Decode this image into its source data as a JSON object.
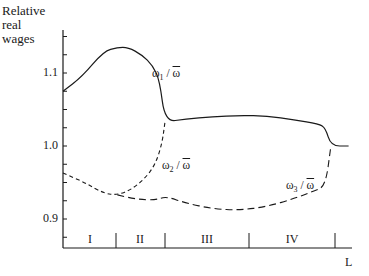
{
  "chart_data": {
    "type": "line",
    "title": "",
    "ylabel": "Relative real wages",
    "ylabel_lines": [
      "Relative",
      "real",
      "wages"
    ],
    "xlabel": "L",
    "ylim": [
      0.86,
      1.16
    ],
    "yticks": [
      {
        "value": 0.9,
        "label": "0.9"
      },
      {
        "value": 1.0,
        "label": "1.0"
      },
      {
        "value": 1.1,
        "label": "1.1"
      }
    ],
    "minor_tick_step": 0.025,
    "grid": false,
    "legend": "none (inline labels)",
    "sections": [
      {
        "label": "I",
        "x_start": 0.0,
        "x_end": 0.195
      },
      {
        "label": "II",
        "x_start": 0.195,
        "x_end": 0.375
      },
      {
        "label": "III",
        "x_start": 0.375,
        "x_end": 0.685
      },
      {
        "label": "IV",
        "x_start": 0.685,
        "x_end": 1.0
      }
    ],
    "series": [
      {
        "name": "ω1 / ω̄",
        "style": "solid",
        "x": [
          0.0,
          0.07,
          0.15,
          0.2,
          0.24,
          0.29,
          0.33,
          0.355,
          0.375,
          0.45,
          0.55,
          0.65,
          0.75,
          0.85,
          0.94,
          0.965,
          0.985,
          1.05
        ],
        "y": [
          1.075,
          1.095,
          1.13,
          1.135,
          1.135,
          1.125,
          1.11,
          1.09,
          1.033,
          1.037,
          1.04,
          1.042,
          1.041,
          1.036,
          1.03,
          1.025,
          1.0,
          1.0
        ]
      },
      {
        "name": "ω2 / ω̄",
        "style": "dashed",
        "x": [
          0.0,
          0.08,
          0.15,
          0.2,
          0.25,
          0.3,
          0.34,
          0.365,
          0.375
        ],
        "y": [
          0.963,
          0.95,
          0.935,
          0.933,
          0.94,
          0.955,
          0.975,
          1.005,
          1.033
        ]
      },
      {
        "name": "ω3 / ω̄",
        "style": "dashed",
        "x": [
          0.2,
          0.27,
          0.34,
          0.38,
          0.45,
          0.55,
          0.65,
          0.75,
          0.85,
          0.92,
          0.965,
          0.985
        ],
        "y": [
          0.933,
          0.927,
          0.926,
          0.931,
          0.922,
          0.914,
          0.912,
          0.917,
          0.928,
          0.938,
          0.945,
          1.0
        ]
      }
    ],
    "annotations": [
      {
        "text": "ω1 / ω̄",
        "near_series": "ω1 / ω̄"
      },
      {
        "text": "ω2 / ω̄",
        "near_series": "ω2 / ω̄"
      },
      {
        "text": "ω3 / ω̄",
        "near_series": "ω3 / ω̄"
      }
    ]
  },
  "labels": {
    "ylabel_line1": "Relative",
    "ylabel_line2": "real",
    "ylabel_line3": "wages",
    "tick_11": "1.1",
    "tick_10": "1.0",
    "tick_09": "0.9",
    "section_1": "I",
    "section_2": "II",
    "section_3": "III",
    "section_4": "IV",
    "xlabel": "L",
    "omega": "ω",
    "sub1": "1",
    "sub2": "2",
    "sub3": "3",
    "slash": " / ",
    "omega_bar": "ω"
  }
}
